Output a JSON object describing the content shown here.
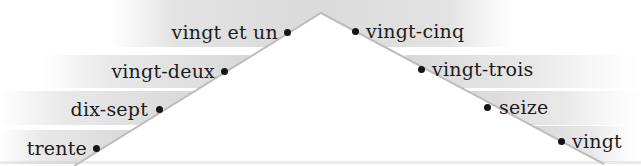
{
  "diagram": {
    "type": "peak-number-mountain",
    "left_labels": [
      "vingt et un",
      "vingt-deux",
      "dix-sept",
      "trente"
    ],
    "right_labels": [
      "vingt-cinq",
      "vingt-trois",
      "seize",
      "vingt"
    ]
  },
  "colors": {
    "background": "#ffffff",
    "highlight_band": "#dcdcdc",
    "mountain_line": "#bdbdbd",
    "label_text": "#1c1c1c",
    "dot": "#151515"
  }
}
